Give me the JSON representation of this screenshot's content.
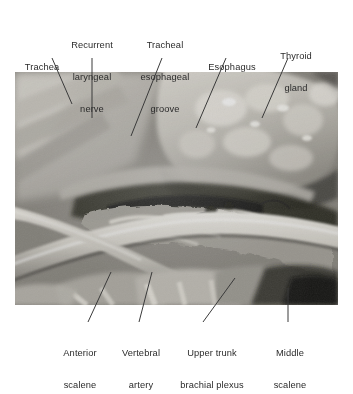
{
  "figure": {
    "kind": "anatomical-dissection-photograph",
    "region": "neck",
    "background_color": "#ffffff",
    "label_color": "#2b2b2b",
    "leader_line_color": "#3a3a3a",
    "photo": {
      "x": 15,
      "y": 72,
      "width": 323,
      "height": 233,
      "tone": "grayscale"
    }
  },
  "labels": {
    "top": [
      {
        "id": "trachea",
        "lines": [
          "Trachea"
        ],
        "cx": 42,
        "baseline_y": 52,
        "leader": {
          "x1": 52,
          "y1": 58,
          "x2": 72,
          "y2": 104
        }
      },
      {
        "id": "recurrent-laryngeal-nerve",
        "lines": [
          "Recurrent",
          "laryngeal",
          "nerve"
        ],
        "cx": 92,
        "baseline_y": 52,
        "leader": {
          "x1": 92,
          "y1": 58,
          "x2": 92,
          "y2": 118
        }
      },
      {
        "id": "tracheal-esophageal-groove",
        "lines": [
          "Tracheal",
          "esophageal",
          "groove"
        ],
        "cx": 165,
        "baseline_y": 52,
        "leader": {
          "x1": 162,
          "y1": 58,
          "x2": 131,
          "y2": 136
        }
      },
      {
        "id": "esophagus",
        "lines": [
          "Esophagus"
        ],
        "cx": 232,
        "baseline_y": 52,
        "leader": {
          "x1": 226,
          "y1": 58,
          "x2": 196,
          "y2": 128
        }
      },
      {
        "id": "thyroid-gland",
        "lines": [
          "Thyroid",
          "gland"
        ],
        "cx": 296,
        "baseline_y": 52,
        "leader": {
          "x1": 288,
          "y1": 58,
          "x2": 262,
          "y2": 118
        }
      }
    ],
    "bottom": [
      {
        "id": "anterior-scalene",
        "lines": [
          "Anterior",
          "scalene"
        ],
        "cx": 80,
        "top_y": 327,
        "leader": {
          "x1": 88,
          "y1": 322,
          "x2": 111,
          "y2": 272
        }
      },
      {
        "id": "vertebral-artery",
        "lines": [
          "Vertebral",
          "artery"
        ],
        "cx": 141,
        "top_y": 327,
        "leader": {
          "x1": 139,
          "y1": 322,
          "x2": 152,
          "y2": 272
        }
      },
      {
        "id": "upper-trunk-brachial-plexus",
        "lines": [
          "Upper trunk",
          "brachial plexus"
        ],
        "cx": 212,
        "top_y": 327,
        "leader": {
          "x1": 203,
          "y1": 322,
          "x2": 235,
          "y2": 278
        }
      },
      {
        "id": "middle-scalene",
        "lines": [
          "Middle",
          "scalene"
        ],
        "cx": 290,
        "top_y": 327,
        "leader": {
          "x1": 288,
          "y1": 322,
          "x2": 288,
          "y2": 288
        }
      }
    ]
  }
}
